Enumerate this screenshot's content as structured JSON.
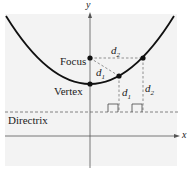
{
  "diagram": {
    "labels": {
      "y_axis": "y",
      "x_axis": "x",
      "focus": "Focus",
      "vertex": "Vertex",
      "directrix": "Directrix",
      "d1_top": "d",
      "d1_top_sub": "1",
      "d2_top": "d",
      "d2_top_sub": "2",
      "d1_vertical": "d",
      "d1_vertical_sub": "1",
      "d2_vertical": "d",
      "d2_vertical_sub": "2"
    },
    "colors": {
      "curve": "#111111",
      "axes": "#555555",
      "dashed": "#666666",
      "background_panel": "#f3f3f3"
    }
  }
}
